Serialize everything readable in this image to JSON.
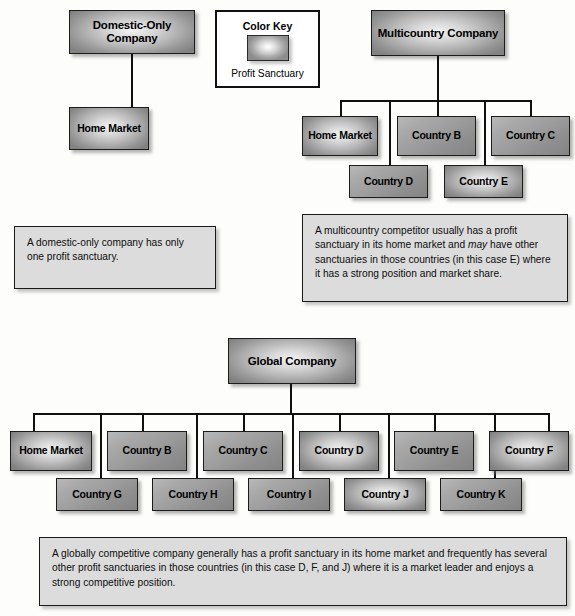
{
  "color_key": {
    "title": "Color Key",
    "swatch_label": "Profit Sanctuary",
    "swatch_name": "profit-sanctuary-swatch"
  },
  "domestic": {
    "root": "Domestic-Only Company",
    "children": [
      "Home Market"
    ],
    "caption": "A domestic-only company has only one profit sanctuary."
  },
  "multicountry": {
    "root": "Multicountry Company",
    "row1": [
      "Home Market",
      "Country B",
      "Country C"
    ],
    "row2": [
      "Country D",
      "Country E"
    ],
    "caption_part1": "A multicountry competitor usually has a profit sanctuary in its home market and ",
    "caption_em": "may",
    "caption_part2": " have other sanctuaries in those countries (in this case E) where it has a strong position and market share."
  },
  "global": {
    "root": "Global Company",
    "row1": [
      "Home Market",
      "Country B",
      "Country C",
      "Country D",
      "Country E",
      "Country F"
    ],
    "row2": [
      "Country G",
      "Country H",
      "Country I",
      "Country J",
      "Country K"
    ],
    "caption": "A globally competitive company generally has a profit sanctuary in its home market and frequently has several other profit sanctuaries in those countries (in this case D, F, and J) where it is a market leader and enjoys a strong competitive position."
  }
}
